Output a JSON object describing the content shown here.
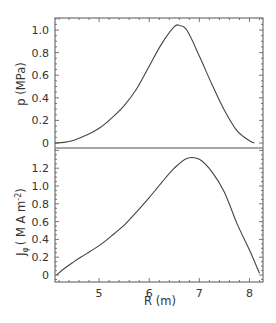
{
  "chart_data": [
    {
      "type": "line",
      "panel": "top",
      "title": "",
      "xlabel": "R (m)",
      "ylabel": "p (MPa)",
      "xlim": [
        4.12,
        8.27
      ],
      "ylim": [
        -0.1,
        1.12
      ],
      "yticks": [
        0,
        0.2,
        0.4,
        0.6,
        0.8,
        1.0
      ],
      "ytick_labels": [
        "0",
        "0.2",
        "0.4",
        "0.6",
        "0.8",
        "1.0"
      ],
      "grid": false,
      "series": [
        {
          "name": "p",
          "x": [
            4.12,
            4.3,
            4.5,
            4.75,
            5.0,
            5.25,
            5.5,
            5.75,
            6.0,
            6.25,
            6.5,
            6.6,
            6.75,
            7.0,
            7.25,
            7.5,
            7.75,
            8.0,
            8.1
          ],
          "values": [
            0.0,
            0.005,
            0.025,
            0.07,
            0.13,
            0.22,
            0.33,
            0.48,
            0.68,
            0.88,
            1.03,
            1.04,
            1.0,
            0.77,
            0.52,
            0.29,
            0.11,
            0.02,
            0.0
          ]
        }
      ]
    },
    {
      "type": "line",
      "panel": "bottom",
      "title": "",
      "xlabel": "R (m)",
      "ylabel": "J_φ ( M A m^-2)",
      "xlim": [
        4.12,
        8.27
      ],
      "ylim": [
        -0.05,
        1.4
      ],
      "xticks": [
        5,
        6,
        7,
        8
      ],
      "xtick_labels": [
        "5",
        "6",
        "7",
        "8"
      ],
      "yticks": [
        0,
        0.2,
        0.4,
        0.6,
        0.8,
        1.0,
        1.2
      ],
      "ytick_labels": [
        "0",
        "0.2",
        "0.4",
        "0.6",
        "0.8",
        "1.0",
        "1.2"
      ],
      "grid": false,
      "series": [
        {
          "name": "J_phi",
          "x": [
            4.15,
            4.3,
            4.5,
            4.75,
            5.0,
            5.25,
            5.5,
            5.75,
            6.0,
            6.25,
            6.5,
            6.75,
            7.0,
            7.25,
            7.5,
            7.75,
            8.0,
            8.2
          ],
          "values": [
            0.0,
            0.07,
            0.15,
            0.24,
            0.33,
            0.44,
            0.56,
            0.71,
            0.87,
            1.04,
            1.2,
            1.31,
            1.3,
            1.16,
            0.93,
            0.58,
            0.28,
            0.02
          ]
        }
      ]
    }
  ],
  "labels": {
    "top_ylabel": "p (MPa)",
    "bottom_ylabel_main": "J",
    "bottom_ylabel_sub": "φ",
    "bottom_ylabel_rest": "( M A m",
    "bottom_ylabel_sup": "-2",
    "bottom_ylabel_close": ")",
    "xlabel": "R (m)"
  },
  "colors": {
    "line": "#444444",
    "axis": "#555555",
    "divider": "#888888"
  }
}
